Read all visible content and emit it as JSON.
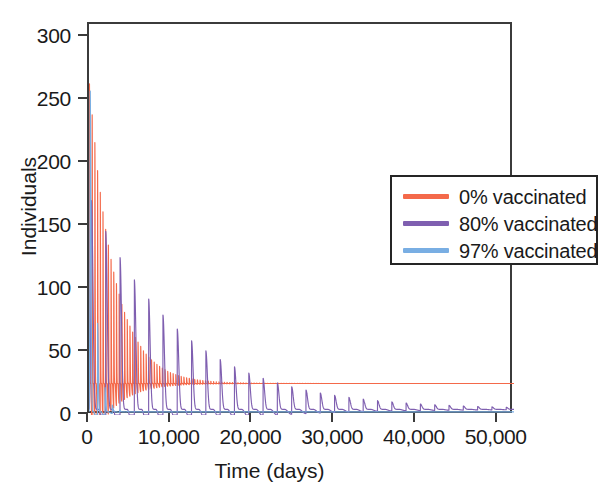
{
  "chart_data": {
    "type": "line",
    "title": "",
    "xlabel": "Time (days)",
    "ylabel": "Individuals",
    "xlim": [
      0,
      52000
    ],
    "ylim": [
      0,
      310
    ],
    "grid": false,
    "legend_position": "upper right inside",
    "xticks": [
      0,
      10000,
      20000,
      30000,
      40000,
      50000
    ],
    "xtick_labels": [
      "0",
      "10,000",
      "20,000",
      "30,000",
      "40,000",
      "50,000"
    ],
    "yticks": [
      0,
      50,
      100,
      150,
      200,
      250,
      300
    ],
    "ytick_labels": [
      "0",
      "50",
      "100",
      "150",
      "200",
      "250",
      "300"
    ],
    "series": [
      {
        "name": "0% vaccinated",
        "color": "#f4694a",
        "initial_peak": 263,
        "second_peak": 185,
        "oscillation_period_days": 330,
        "damping_days": 3000,
        "steady_state": 25,
        "description": "Rapid, densely packed damped oscillations collapsing to an endemic plateau near 25 individuals by about 10,000 days."
      },
      {
        "name": "80% vaccinated",
        "color": "#7f5fb0",
        "initial_peak": 170,
        "second_peak": 123,
        "oscillation_period_days": 1750,
        "damping_days": 11000,
        "steady_state": 4.5,
        "description": "Slow, long-period spike train of decreasing amplitude settling near 4.5 individuals with small residual ripples."
      },
      {
        "name": "97% vaccinated",
        "color": "#79aee3",
        "initial_peak": 258,
        "second_peak": 6,
        "oscillation_period_days": 900,
        "damping_days": 700,
        "steady_state": 2.5,
        "description": "Single tall initial outbreak spike, then an immediate collapse to a near-zero flat line around 2.5 individuals."
      }
    ]
  },
  "legend": {
    "items": [
      {
        "label": "0% vaccinated",
        "color": "#f4694a"
      },
      {
        "label": "80% vaccinated",
        "color": "#7f5fb0"
      },
      {
        "label": "97% vaccinated",
        "color": "#79aee3"
      }
    ]
  }
}
